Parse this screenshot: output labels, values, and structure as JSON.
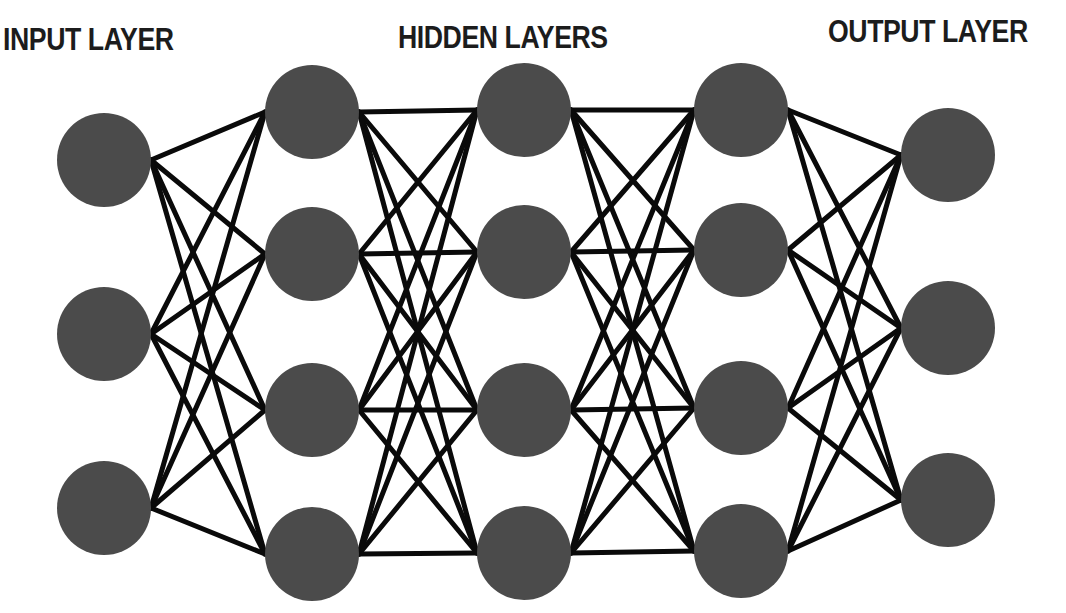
{
  "labels": {
    "input": "INPUT LAYER",
    "hidden": "HIDDEN LAYERS",
    "output": "OUTPUT LAYER"
  },
  "style": {
    "node_color": "#4b4b4b",
    "edge_color": "#0a0a0a",
    "label_color": "#1c1c1c",
    "background": "#ffffff",
    "node_radius": 47,
    "edge_width": 5
  },
  "network": {
    "layers": [
      {
        "name": "input",
        "x": 104,
        "nodes_y": [
          160,
          334,
          508
        ]
      },
      {
        "name": "hidden-1",
        "x": 312,
        "nodes_y": [
          112,
          254,
          410,
          554
        ]
      },
      {
        "name": "hidden-2",
        "x": 524,
        "nodes_y": [
          110,
          252,
          410,
          553
        ]
      },
      {
        "name": "hidden-3",
        "x": 741,
        "nodes_y": [
          110,
          250,
          408,
          551
        ]
      },
      {
        "name": "output",
        "x": 948,
        "nodes_y": [
          155,
          328,
          500
        ]
      }
    ],
    "connectivity": "fully-connected between adjacent layers"
  }
}
